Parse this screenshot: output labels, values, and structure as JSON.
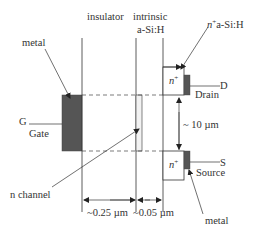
{
  "diagram": {
    "labels": {
      "insulator": "insulator",
      "intrinsic": "intrinsic",
      "asih": "a-Si:H",
      "nplus_asih_n": "n",
      "nplus_asih_sup": "+",
      "nplus_asih_rest": "a-Si:H",
      "metal_top": "metal",
      "metal_bottom": "metal",
      "gate_letter": "G",
      "gate": "Gate",
      "drain_letter": "D",
      "drain": "Drain",
      "source_letter": "S",
      "source": "Source",
      "n_channel": "n channel",
      "nplus_top_n": "n",
      "nplus_top_sup": "+",
      "nplus_bottom_n": "n",
      "nplus_bottom_sup": "+",
      "channel_length": "~ 10 µm",
      "insulator_thickness": "~0.25 µm",
      "asih_thickness": "~0.05 µm"
    },
    "colors": {
      "line": "#333333",
      "metal_fill": "#555555",
      "channel_fill": "#eeeeee"
    }
  }
}
